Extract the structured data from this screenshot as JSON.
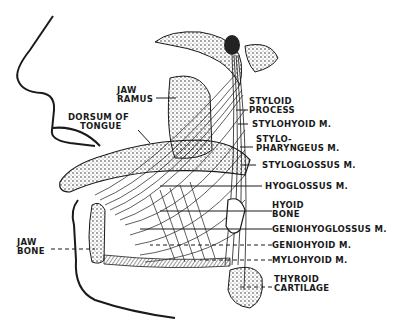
{
  "diagram": {
    "colors": {
      "ink": "#1a1a1a",
      "background": "#ffffff",
      "hatch": "#555555"
    },
    "labels": {
      "jaw_ramus": {
        "line1": "JAW",
        "line2": "RAMUS"
      },
      "dorsum_of_tongue": {
        "line1": "DORSUM OF",
        "line2": "TONGUE"
      },
      "jaw_bone": {
        "line1": "JAW",
        "line2": "BONE"
      },
      "styloid_process": {
        "line1": "STYLOID",
        "line2": "PROCESS"
      },
      "stylohyoid": {
        "line1": "STYLOHYOID M."
      },
      "stylopharyngeus": {
        "line1": "STYLO-",
        "line2": "PHARYNGEUS M."
      },
      "styloglossus": {
        "line1": "STYLOGLOSSUS M."
      },
      "hyoglossus": {
        "line1": "HYOGLOSSUS M."
      },
      "hyoid_bone": {
        "line1": "HYOID",
        "line2": "BONE"
      },
      "genioglossus": {
        "line1": "GENIOHYOGLOSSUS M."
      },
      "geniohyoid": {
        "line1": "GENIOHYOID M."
      },
      "mylohyoid": {
        "line1": "MYLOHYOID M."
      },
      "thyroid_cartilage": {
        "line1": "THYROID",
        "line2": "CARTILAGE"
      }
    }
  }
}
